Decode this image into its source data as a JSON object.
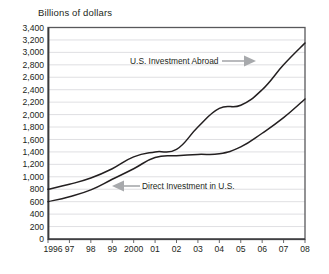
{
  "chart_data": {
    "type": "line",
    "title": "Billions of dollars",
    "xlabel": "",
    "ylabel": "Billions of dollars",
    "grid": true,
    "legend_position": "inline-annotations",
    "categories": [
      "1996",
      "97",
      "98",
      "99",
      "2000",
      "01",
      "02",
      "03",
      "04",
      "05",
      "06",
      "07",
      "08"
    ],
    "x": [
      1996,
      1997,
      1998,
      1999,
      2000,
      2001,
      2002,
      2003,
      2004,
      2005,
      2006,
      2007,
      2008
    ],
    "ylim": [
      0,
      3400
    ],
    "ytick_labels": [
      "0",
      "200",
      "400",
      "600",
      "800",
      "1,000",
      "1,200",
      "1,400",
      "1,600",
      "1,800",
      "2,000",
      "2,200",
      "2,400",
      "2,600",
      "2,800",
      "3,000",
      "3,200",
      "3,400"
    ],
    "ytick_values": [
      0,
      200,
      400,
      600,
      800,
      1000,
      1200,
      1400,
      1600,
      1800,
      2000,
      2200,
      2400,
      2600,
      2800,
      3000,
      3200,
      3400
    ],
    "series": [
      {
        "name": "U.S. Investment Abroad",
        "values": [
          800,
          880,
          980,
          1130,
          1320,
          1400,
          1440,
          1800,
          2100,
          2150,
          2400,
          2800,
          3150
        ]
      },
      {
        "name": "Direct Investment in U.S.",
        "values": [
          600,
          680,
          790,
          960,
          1130,
          1310,
          1340,
          1360,
          1370,
          1480,
          1700,
          1950,
          2250
        ]
      }
    ],
    "annotations": [
      {
        "text": "U.S. Investment Abroad",
        "arrow": "right",
        "target_series": "U.S. Investment Abroad"
      },
      {
        "text": "Direct Investment in U.S.",
        "arrow": "left",
        "target_series": "Direct Investment in U.S."
      }
    ],
    "colors": {
      "line": "#231f20",
      "grid": "#c9c9cf",
      "frame": "#58585b",
      "annotation_arrow": "#a7a9ac",
      "background": "#ffffff"
    }
  }
}
